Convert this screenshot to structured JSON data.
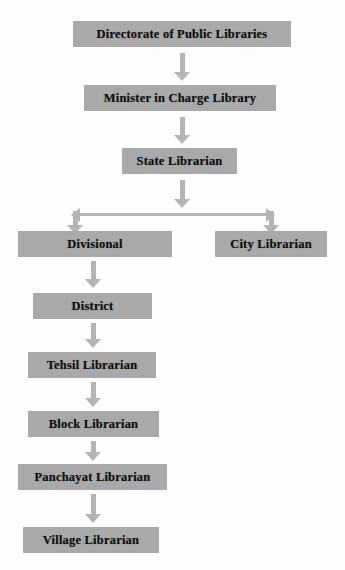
{
  "diagram": {
    "type": "organizational-hierarchy-flowchart",
    "orientation": "top-down",
    "node_fill_color": "#a9a9a9",
    "arrow_color": "#b4b4b4",
    "text_color": "#101010",
    "background_color": "#fdfdfc",
    "nodes": [
      {
        "id": "directorate",
        "label": "Directorate of Public Libraries",
        "level": 1,
        "x": 73,
        "y": 21,
        "width": 218
      },
      {
        "id": "minister",
        "label": "Minister in Charge Library",
        "level": 2,
        "x": 84,
        "y": 85,
        "width": 192
      },
      {
        "id": "state",
        "label": "State Librarian",
        "level": 3,
        "x": 122,
        "y": 148,
        "width": 115
      },
      {
        "id": "divisional",
        "label": "Divisional",
        "level": 4,
        "x": 18,
        "y": 231,
        "width": 154
      },
      {
        "id": "city",
        "label": "City Librarian",
        "level": 4,
        "x": 215,
        "y": 231,
        "width": 112
      },
      {
        "id": "district",
        "label": "District",
        "level": 5,
        "x": 33,
        "y": 293,
        "width": 119
      },
      {
        "id": "tehsil",
        "label": "Tehsil Librarian",
        "level": 6,
        "x": 28,
        "y": 352,
        "width": 128
      },
      {
        "id": "block",
        "label": "Block Librarian",
        "level": 7,
        "x": 28,
        "y": 411,
        "width": 131
      },
      {
        "id": "panchayat",
        "label": "Panchayat Librarian",
        "level": 8,
        "x": 18,
        "y": 464,
        "width": 149
      },
      {
        "id": "village",
        "label": "Village Librarian",
        "level": 9,
        "x": 23,
        "y": 527,
        "width": 136
      }
    ],
    "edges": [
      {
        "id": "edge-directorate-minister",
        "from": "directorate",
        "to": "minister",
        "style": "arrow-down"
      },
      {
        "id": "edge-minister-state",
        "from": "minister",
        "to": "state",
        "style": "arrow-down"
      },
      {
        "id": "edge-state-branch",
        "from": "state",
        "to": "branch",
        "style": "arrow-down"
      },
      {
        "id": "edge-branch-divisional",
        "from": "branch",
        "to": "divisional",
        "style": "branch-drop-left"
      },
      {
        "id": "edge-branch-city",
        "from": "branch",
        "to": "city",
        "style": "branch-drop-right"
      },
      {
        "id": "edge-divisional-district",
        "from": "divisional",
        "to": "district",
        "style": "arrow-down"
      },
      {
        "id": "edge-district-tehsil",
        "from": "district",
        "to": "tehsil",
        "style": "arrow-down"
      },
      {
        "id": "edge-tehsil-block",
        "from": "tehsil",
        "to": "block",
        "style": "arrow-down"
      },
      {
        "id": "edge-block-panchayat",
        "from": "block",
        "to": "panchayat",
        "style": "arrow-down"
      },
      {
        "id": "edge-panchayat-village",
        "from": "panchayat",
        "to": "village",
        "style": "arrow-down"
      }
    ],
    "branch_connector": {
      "id": "state-branch",
      "left_x": 73,
      "right_x": 271,
      "bar_y": 213,
      "note": "horizontal bar with outward-pointing arrowheads at both ends, each turning downward into an arrow"
    }
  }
}
